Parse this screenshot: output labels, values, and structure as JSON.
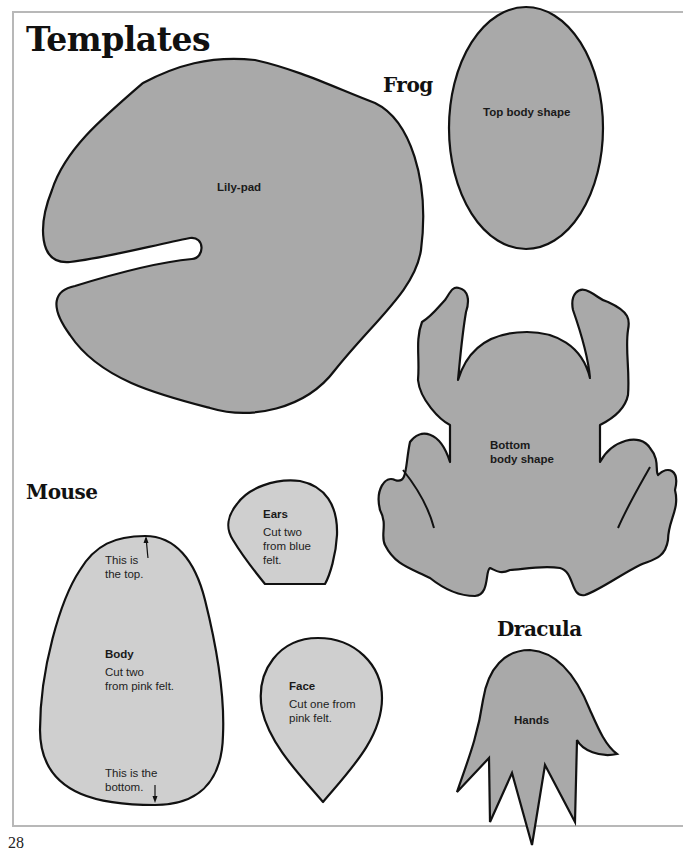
{
  "page": {
    "title": "Templates",
    "page_number": "28",
    "colors": {
      "dark_felt": "#a9a9a9",
      "light_felt": "#cfcfcf",
      "outline": "#111111",
      "frame": "#b8b8b8"
    }
  },
  "sections": {
    "frog": {
      "heading": "Frog",
      "templates": {
        "lily_pad": {
          "label": "Lily-pad"
        },
        "top_body": {
          "label": "Top body shape"
        },
        "bottom_body": {
          "label_line1": "Bottom",
          "label_line2": "body shape"
        }
      }
    },
    "mouse": {
      "heading": "Mouse",
      "templates": {
        "ears": {
          "label": "Ears",
          "instruction_line1": "Cut two",
          "instruction_line2": "from blue",
          "instruction_line3": "felt."
        },
        "body": {
          "label": "Body",
          "instruction_line1": "Cut two",
          "instruction_line2": "from pink felt.",
          "top_note_line1": "This is",
          "top_note_line2": "the top.",
          "bottom_note_line1": "This is the",
          "bottom_note_line2": "bottom."
        },
        "face": {
          "label": "Face",
          "instruction_line1": "Cut one from",
          "instruction_line2": "pink felt."
        }
      }
    },
    "dracula": {
      "heading": "Dracula",
      "templates": {
        "hands": {
          "label": "Hands"
        }
      }
    }
  }
}
